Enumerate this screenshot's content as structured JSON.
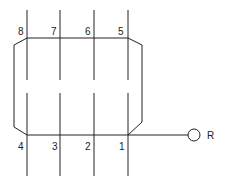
{
  "diagram": {
    "type": "winding-connection",
    "conductors_top": [
      {
        "label": "8",
        "x": 27
      },
      {
        "label": "7",
        "x": 60
      },
      {
        "label": "6",
        "x": 94
      },
      {
        "label": "5",
        "x": 128
      }
    ],
    "conductors_bottom": [
      {
        "label": "4",
        "x": 27
      },
      {
        "label": "3",
        "x": 60
      },
      {
        "label": "2",
        "x": 94
      },
      {
        "label": "1",
        "x": 128
      }
    ],
    "terminal": {
      "label": "R"
    },
    "colors": {
      "stroke": "#222222",
      "background": "#ffffff"
    }
  }
}
